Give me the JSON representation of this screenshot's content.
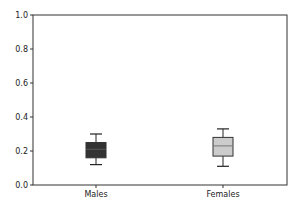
{
  "chart_data": {
    "type": "boxplot",
    "title": "",
    "xlabel": "",
    "ylabel": "",
    "categories": [
      "Males",
      "Females"
    ],
    "ylim": [
      0.0,
      1.0
    ],
    "yticks": [
      "0.0",
      "0.2",
      "0.4",
      "0.6",
      "0.8",
      "1.0"
    ],
    "grid": false,
    "legend": null,
    "series": [
      {
        "name": "Males",
        "whisker_low": 0.12,
        "q1": 0.16,
        "median": 0.21,
        "q3": 0.25,
        "whisker_high": 0.3,
        "fill_color": "#333333",
        "median_color": "#555555"
      },
      {
        "name": "Females",
        "whisker_low": 0.11,
        "q1": 0.17,
        "median": 0.23,
        "q3": 0.28,
        "whisker_high": 0.33,
        "fill_color": "#cccccc",
        "median_color": "#777777"
      }
    ]
  }
}
